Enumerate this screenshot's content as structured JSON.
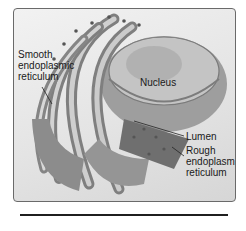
{
  "figure": {
    "labels": {
      "smooth_er": "Smooth\nendoplasmic\nreticulum",
      "nucleus": "Nucleus",
      "lumen": "Lumen",
      "rough_er": "Rough\nendoplasmic\nreticulum"
    },
    "colors": {
      "frame_border": "#6a6a6a",
      "background": "#e4e4e4",
      "membrane": "#8a8a8a",
      "membrane_light": "#c9c9c9",
      "nucleus": "#a8a8a8",
      "ribosome": "#555555",
      "rule": "#1f1f1f"
    }
  }
}
